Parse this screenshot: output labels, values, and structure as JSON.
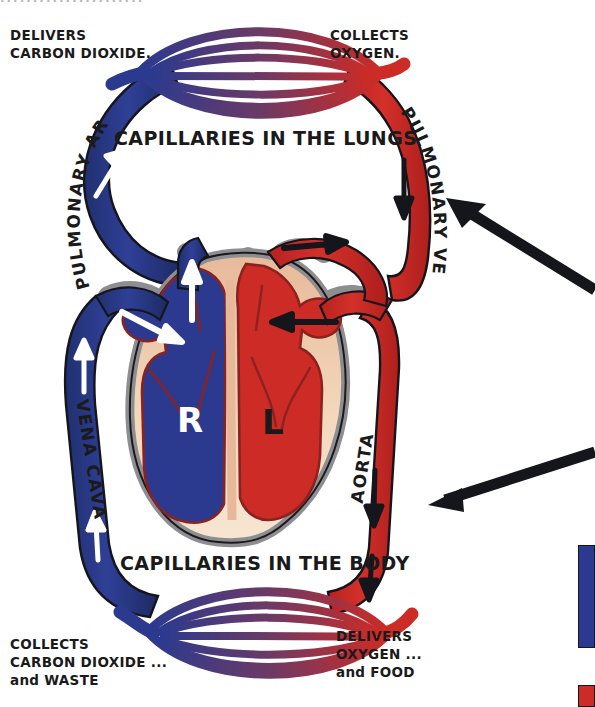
{
  "diagram": {
    "title_cut_off": "......................",
    "captions": {
      "lungs": "CAPILLARIES IN THE LUNGS",
      "body": "CAPILLARIES IN THE BODY"
    },
    "corner_notes": {
      "top_left": [
        "DELIVERS",
        "CARBON DIOXIDE."
      ],
      "top_right": [
        "COLLECTS",
        "OXYGEN."
      ],
      "bottom_left": [
        "COLLECTS",
        "CARBON DIOXIDE ...",
        "and WASTE"
      ],
      "bottom_right": [
        "DELIVERS",
        "OXYGEN ...",
        "and FOOD"
      ]
    },
    "vessels": {
      "pulmonary_artery": "PULMONARY ARTERY",
      "pulmonary_vein": "PULMONARY VEIN",
      "vena_cava": "VENA CAVA",
      "aorta": "AORTA"
    },
    "chambers": {
      "right": "R",
      "left": "L"
    },
    "colors": {
      "deoxygenated_blue": "#2b3a8f",
      "oxygenated_red": "#cc2b26",
      "capillary_mid_purple": "#6b3a66",
      "vessel_wall_grey": "#8e8e92",
      "muscle_tan": "#f0cfae",
      "outline_black": "#1a1a1a",
      "annotation_arrow": "#15151c"
    },
    "legend_swatches": [
      {
        "name": "blue-swatch",
        "color": "#2b3a8f"
      },
      {
        "name": "red-swatch",
        "color": "#cc2b26"
      }
    ],
    "annotation_arrows": [
      {
        "name": "arrow-to-pulmonary-vein",
        "direction": "up-left"
      },
      {
        "name": "arrow-to-aorta",
        "direction": "left"
      }
    ]
  }
}
